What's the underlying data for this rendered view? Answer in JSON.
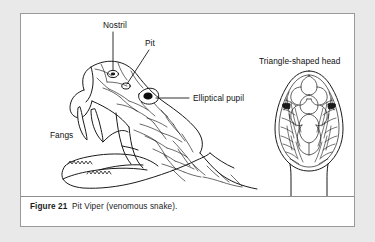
{
  "figure": {
    "caption_number": "Figure 21",
    "caption_text": "Pit Viper (venomous snake).",
    "background_color": "#e9e9e9",
    "card_background": "#ffffff",
    "border_color": "#9a9a9a",
    "ink_color": "#111111"
  },
  "labels": {
    "nostril": "Nostril",
    "pit": "Pit",
    "elliptical_pupil": "Elliptical pupil",
    "fangs": "Fangs",
    "triangle_head": "Triangle-shaped head"
  },
  "illustration": {
    "left_view_name": "pit-viper-head-side-view-open-mouth",
    "right_view_name": "pit-viper-head-top-view-triangular"
  }
}
